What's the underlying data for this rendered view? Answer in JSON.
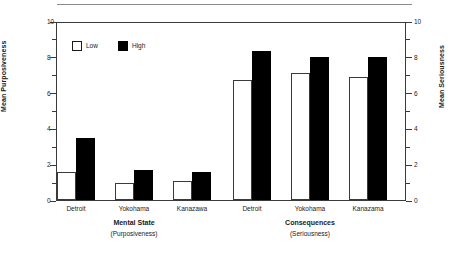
{
  "chart_data": {
    "type": "bar",
    "title": "",
    "subtitle": "",
    "grid": false,
    "legend_position": "top-left",
    "legend": [
      "Low",
      "High"
    ],
    "series": [
      {
        "name": "Low",
        "color": "#ffffff",
        "values": [
          1.55,
          0.95,
          1.05,
          6.7,
          7.1,
          6.9
        ]
      },
      {
        "name": "High",
        "color": "#000000",
        "values": [
          3.45,
          1.65,
          1.55,
          8.3,
          8.0,
          8.0
        ]
      }
    ],
    "categories": [
      "Detroit",
      "Yokohama",
      "Kanazawa",
      "Detroit",
      "Yokohama",
      "Kanazama"
    ],
    "groups": [
      {
        "title": "Mental State",
        "subtitle": "(Purposiveness)",
        "categories": [
          "Detroit",
          "Yokohama",
          "Kanazawa"
        ],
        "low": [
          1.55,
          0.95,
          1.05
        ],
        "high": [
          3.45,
          1.65,
          1.55
        ]
      },
      {
        "title": "Consequences",
        "subtitle": "(Seriousness)",
        "categories": [
          "Detroit",
          "Yokohama",
          "Kanazama"
        ],
        "low": [
          6.7,
          7.1,
          6.9
        ],
        "high": [
          8.3,
          8.0,
          8.0
        ]
      }
    ],
    "xlabel": "",
    "ylabel": "Mean Purposiveness",
    "y2label": "Mean Seriousness",
    "ylim": [
      0,
      10
    ],
    "y2lim": [
      0,
      10
    ],
    "yticks": [
      0,
      2,
      4,
      6,
      8,
      10
    ],
    "yticklabels": [
      "0",
      "2",
      "4",
      "6",
      "8",
      "10"
    ],
    "yminorticks": [
      1,
      3,
      5,
      7,
      9
    ],
    "y2ticks": [
      0,
      2,
      4,
      6,
      8,
      10
    ],
    "y2ticklabels": [
      "0",
      "2",
      "4",
      "6",
      "8",
      "10"
    ]
  },
  "axes": {
    "left_title": "Mean Purposiveness",
    "right_title": "Mean Seriousness",
    "tick_labels": [
      "10",
      "8",
      "6",
      "4",
      "2",
      "0"
    ]
  },
  "legend": {
    "items": [
      {
        "label": "Low",
        "swatch": "hollow-square"
      },
      {
        "label": "High",
        "swatch": "filled-square"
      }
    ]
  },
  "groups": [
    {
      "title": "Mental State",
      "subtitle": "(Purposiveness)",
      "labels": [
        "Detroit",
        "Yokohama",
        "Kanazawa"
      ]
    },
    {
      "title": "Consequences",
      "subtitle": "(Seriousness)",
      "labels": [
        "Detroit",
        "Yokohama",
        "Kanazama"
      ]
    }
  ]
}
